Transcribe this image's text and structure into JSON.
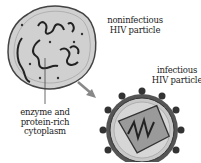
{
  "labels": {
    "noninfectious_line1": "noninfectious",
    "noninfectious_line2": "HIV particle",
    "infectious_line1": "infectious",
    "infectious_line2": "HIV particle",
    "cytoplasm_line1": "enzyme and",
    "cytoplasm_line2": "protein-rich",
    "cytoplasm_line3": "cytoplasm"
  },
  "colors": {
    "cell_fill": "#d4d4d4",
    "outline": "#333333",
    "arrow": "#888888"
  }
}
